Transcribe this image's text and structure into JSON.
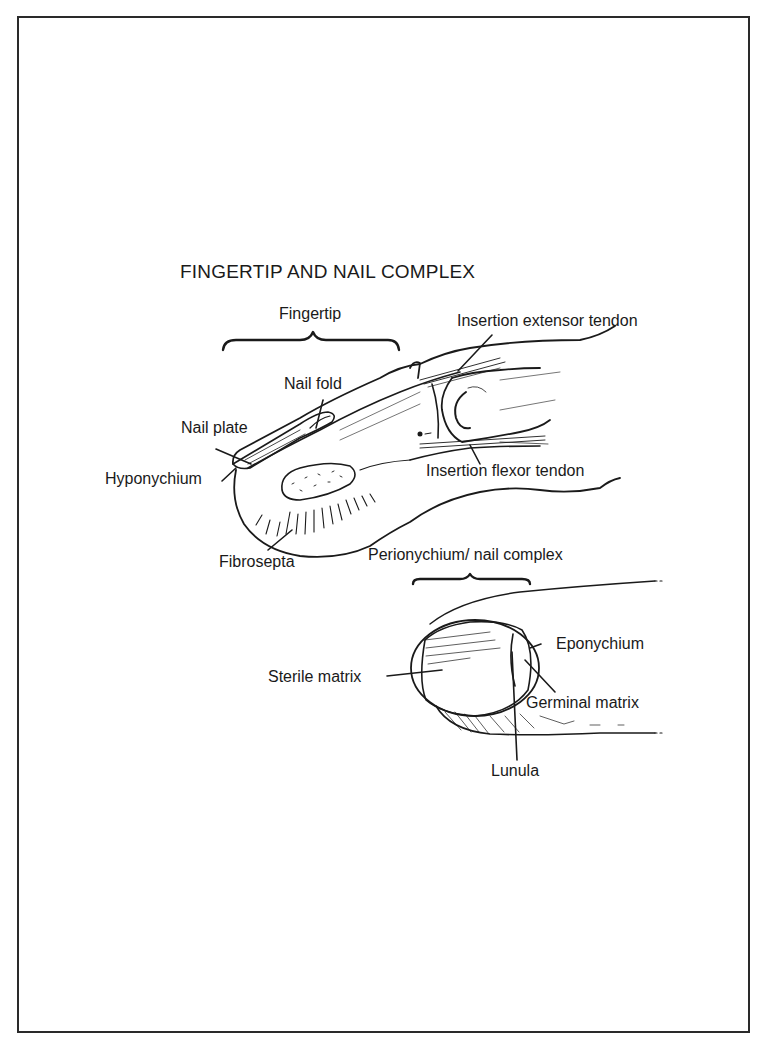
{
  "figure": {
    "title": "FINGERTIP AND NAIL COMPLEX",
    "colors": {
      "ink": "#1a1a1a",
      "paper": "#ffffff",
      "frame": "#2a2a2a"
    }
  },
  "top_view": {
    "bracket_label": "Fingertip",
    "labels": {
      "insertion_extensor": "Insertion extensor tendon",
      "nail_fold": "Nail fold",
      "nail_plate": "Nail plate",
      "hyponychium": "Hyponychium",
      "insertion_flexor": "Insertion flexor tendon",
      "fibrosepta": "Fibrosepta"
    }
  },
  "bottom_view": {
    "bracket_label": "Perionychium/ nail complex",
    "labels": {
      "eponychium": "Eponychium",
      "sterile_matrix": "Sterile matrix",
      "germinal_matrix": "Germinal matrix",
      "lunula": "Lunula"
    }
  }
}
